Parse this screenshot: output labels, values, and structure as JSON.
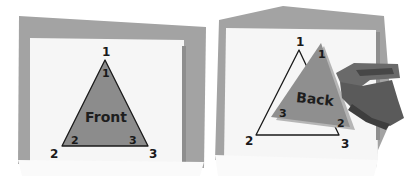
{
  "panels": [
    {
      "id": "front",
      "face_label": "Front",
      "outer_vertex_labels": {
        "top": "1",
        "bottom_left": "2",
        "bottom_right": "3"
      },
      "inner_vertex_labels": {
        "top": "1",
        "bottom_left": "2",
        "bottom_right": "3"
      }
    },
    {
      "id": "back",
      "face_label": "Back",
      "outer_vertex_labels": {
        "top": "1",
        "bottom_left": "2",
        "bottom_right": "3"
      },
      "inner_vertex_labels": {
        "top": "1",
        "bottom_left": "3",
        "bottom_right": "2"
      }
    }
  ],
  "colors": {
    "frame": "#9e9e9e",
    "frame_dark": "#8a8a8a",
    "paper": "#f7f7f7",
    "triangle_fill": "#8c8c8c",
    "triangle_back_fill": "#959595",
    "triangle_back_shadow": "#b0b0b0",
    "outline": "#1a1a1a",
    "hand": "#6e6e6e",
    "hand_dark": "#4a4a4a"
  }
}
